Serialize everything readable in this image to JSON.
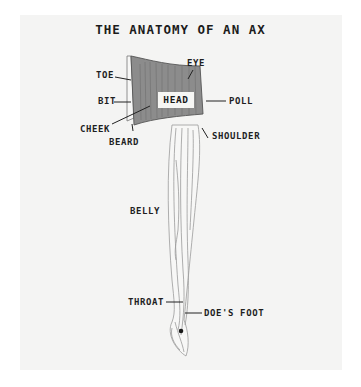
{
  "title": "THE ANATOMY OF AN AX",
  "labels": {
    "toe": "TOE",
    "eye": "EYE",
    "bit": "BIT",
    "head": "HEAD",
    "poll": "POLL",
    "cheek": "CHEEK",
    "beard": "BEARD",
    "shoulder": "SHOULDER",
    "belly": "BELLY",
    "throat": "THROAT",
    "does_foot": "DOE'S FOOT"
  },
  "colors": {
    "background": "#ffffff",
    "panel": "#f4f4f3",
    "ink": "#1f1f1f",
    "head_fill": "#8a8a8a",
    "handle_line": "#9a9a9a"
  }
}
